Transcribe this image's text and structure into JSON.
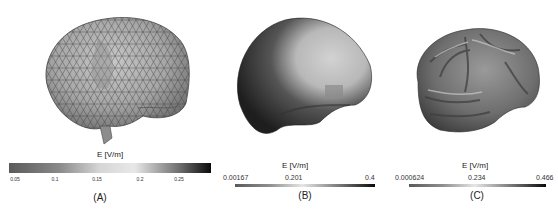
{
  "figure": {
    "panels": [
      {
        "id": "A",
        "caption": "(A)",
        "quantity_label": "E [V/m]",
        "description": "Coarse triangulated brain surface mesh, grayscale field map",
        "colorbar": {
          "ticks": [
            "0.05",
            "0.1",
            "0.15",
            "0.2",
            "0.25"
          ],
          "gradient": [
            "#5a5a5a",
            "#8a8a8a",
            "#d6d6d6",
            "#e8e8e8",
            "#6a6a6a",
            "#0a0a0a"
          ]
        }
      },
      {
        "id": "B",
        "caption": "(B)",
        "quantity_label": "E [V/m]",
        "description": "Smooth head/brain surface, grayscale field map",
        "colorbar": {
          "ticks": [
            "0.00167",
            "0.201",
            "0.4"
          ],
          "gradient": [
            "#5a5a5a",
            "#8f8f8f",
            "#e6e6e6",
            "#6a6a6a",
            "#0a0a0a"
          ]
        }
      },
      {
        "id": "C",
        "caption": "(C)",
        "quantity_label": "E [V/m]",
        "description": "Gyrified cortical surface, grayscale field map",
        "colorbar": {
          "ticks": [
            "0.000624",
            "0.234",
            "0.466"
          ],
          "gradient": [
            "#5a5a5a",
            "#8f8f8f",
            "#e6e6e6",
            "#6a6a6a",
            "#0a0a0a"
          ]
        }
      }
    ]
  }
}
